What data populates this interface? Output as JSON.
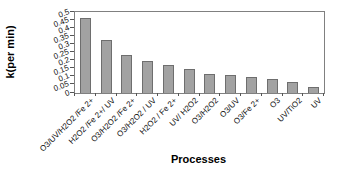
{
  "chart_data": {
    "type": "bar",
    "title": "",
    "xlabel": "Processes",
    "ylabel": "k(per min)",
    "ylim": [
      0,
      0.5
    ],
    "ytick_step": 0.05,
    "ytick_labels": [
      "0",
      "0.05",
      "0.1",
      "0.15",
      "0.2",
      "0.25",
      "0.3",
      "0.35",
      "0.4",
      "0.45",
      "0.5"
    ],
    "categories": [
      "O3/UV/H2O2 /Fe 2+",
      "H2O2 /Fe 2+/ UV",
      "O3/H2O2 /Fe 2+",
      "O3/H2O2 / UV",
      "H2O2 / Fe 2+",
      "UV/ H2O2",
      "O3/H2O2",
      "O3/UV",
      "O3/Fe 2+",
      "O3",
      "UV/TiO2",
      "UV"
    ],
    "values": [
      0.46,
      0.33,
      0.235,
      0.2,
      0.17,
      0.15,
      0.115,
      0.11,
      0.1,
      0.085,
      0.065,
      0.035
    ],
    "bar_color": "#a2a2a2",
    "bar_border_color": "#6e6e6e",
    "grid": false,
    "legend": false
  }
}
